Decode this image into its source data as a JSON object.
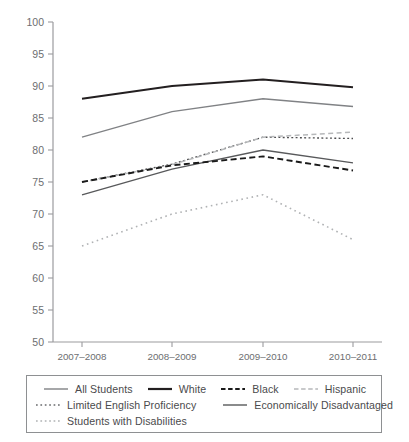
{
  "chart_data": {
    "type": "line",
    "title": "",
    "subtitle": "",
    "xlabel": "",
    "ylabel": "",
    "categories": [
      "2007–2008",
      "2008–2009",
      "2009–2010",
      "2010–2011"
    ],
    "ylim": [
      50,
      100
    ],
    "yticks": [
      50,
      55,
      60,
      65,
      70,
      75,
      80,
      85,
      90,
      95,
      100
    ],
    "grid": false,
    "legend_position": "bottom",
    "series": [
      {
        "name": "All Students",
        "values": [
          82,
          86,
          88,
          86.8
        ],
        "style": "solid-gray",
        "color": "#808285"
      },
      {
        "name": "White",
        "values": [
          88,
          90,
          91,
          89.8
        ],
        "style": "solid-thick-black",
        "color": "#231f20"
      },
      {
        "name": "Black",
        "values": [
          75,
          77.6,
          79,
          76.8
        ],
        "style": "dashed-black",
        "color": "#1a1a1a"
      },
      {
        "name": "Hispanic",
        "values": [
          75,
          77.7,
          82,
          82.8
        ],
        "style": "dashed-light",
        "color": "#b6b8ba"
      },
      {
        "name": "Limited English Proficiency",
        "values": [
          75,
          77.8,
          82,
          81.8
        ],
        "style": "dotted-dark",
        "color": "#4d4d4f"
      },
      {
        "name": "Economically Disadvantaged",
        "values": [
          73,
          77,
          80,
          78
        ],
        "style": "solid-dark",
        "color": "#58595b"
      },
      {
        "name": "Students with Disabilities",
        "values": [
          65,
          70,
          73,
          66
        ],
        "style": "dotted-light",
        "color": "#b0b2b4"
      }
    ]
  },
  "axis": {
    "y_tick_labels": [
      "100",
      "95",
      "90",
      "85",
      "80",
      "75",
      "70",
      "65",
      "60",
      "55",
      "50"
    ],
    "x_tick_labels": [
      "2007–2008",
      "2008–2009",
      "2009–2010",
      "2010–2011"
    ]
  },
  "legend": {
    "rows": [
      [
        {
          "label": "All Students",
          "swatch": "solid-gray"
        },
        {
          "label": "White",
          "swatch": "solid-thick-black"
        },
        {
          "label": "Black",
          "swatch": "dashed-black"
        },
        {
          "label": "Hispanic",
          "swatch": "dashed-light"
        }
      ],
      [
        {
          "label": "Limited English Proficiency",
          "swatch": "dotted-dark"
        },
        {
          "label": "Economically Disadvantaged",
          "swatch": "solid-dark"
        }
      ],
      [
        {
          "label": "Students with Disabilities",
          "swatch": "dotted-light"
        }
      ]
    ]
  },
  "colors": {
    "axis": "#9b9b9e",
    "text": "#6d6e71",
    "legend_border": "#8e9092",
    "background": "#ffffff"
  }
}
